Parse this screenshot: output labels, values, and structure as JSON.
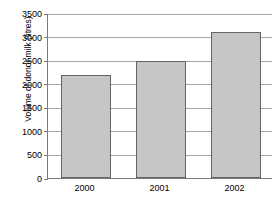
{
  "chart_data": {
    "type": "bar",
    "title": "",
    "xlabel": "",
    "ylabel": "Volume of donor milk (litres)",
    "categories": [
      "2000",
      "2001",
      "2002"
    ],
    "values": [
      2180,
      2480,
      3090
    ],
    "series": [
      {
        "name": "Volume of donor milk",
        "values": [
          2180,
          2480,
          3090
        ]
      }
    ],
    "ylim": [
      0,
      3500
    ],
    "ytick_step": 500,
    "yticks": [
      0,
      500,
      1000,
      1500,
      2000,
      2500,
      3000,
      3500
    ],
    "ytick_labels": [
      "0",
      "500",
      "1000",
      "1500",
      "2000",
      "2500",
      "3000",
      "3500"
    ],
    "grid": true,
    "grid_axis": "y",
    "legend": false,
    "legend_position": "none",
    "bar_fill_color": "#c6c6c6",
    "bar_border_color": "#646464",
    "gridline_color": "#a6a6a6",
    "axis_color": "#7a7a7a",
    "background_color": "#ffffff"
  }
}
